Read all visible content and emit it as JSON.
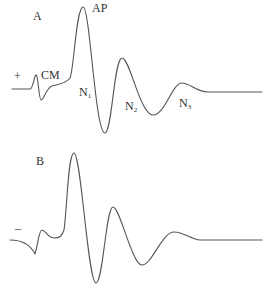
{
  "panels": [
    {
      "id": "A",
      "panel_label": "A",
      "polarity": "+",
      "labels": {
        "cm": "CM",
        "ap": "AP",
        "n1_main": "N",
        "n1_sub": "1",
        "n2_main": "N",
        "n2_sub": "2",
        "n3_main": "N",
        "n3_sub": "3"
      }
    },
    {
      "id": "B",
      "panel_label": "B",
      "polarity": "–"
    }
  ],
  "colors": {
    "trace": "#555555",
    "text": "#333333",
    "background": "#ffffff"
  }
}
